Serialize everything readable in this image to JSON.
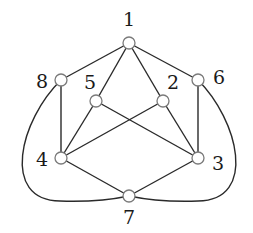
{
  "diagram": {
    "type": "graph",
    "nodes": [
      {
        "id": "1",
        "label": "1",
        "x": 129,
        "y": 43,
        "lx": 129,
        "ly": 26
      },
      {
        "id": "2",
        "label": "2",
        "x": 163,
        "y": 101,
        "lx": 173,
        "ly": 89
      },
      {
        "id": "3",
        "label": "3",
        "x": 198,
        "y": 158,
        "lx": 218,
        "ly": 170
      },
      {
        "id": "4",
        "label": "4",
        "x": 61,
        "y": 158,
        "lx": 42,
        "ly": 166
      },
      {
        "id": "5",
        "label": "5",
        "x": 96,
        "y": 101,
        "lx": 90,
        "ly": 89
      },
      {
        "id": "6",
        "label": "6",
        "x": 198,
        "y": 80,
        "lx": 219,
        "ly": 84
      },
      {
        "id": "7",
        "label": "7",
        "x": 129,
        "y": 196,
        "lx": 129,
        "ly": 224
      },
      {
        "id": "8",
        "label": "8",
        "x": 61,
        "y": 80,
        "lx": 42,
        "ly": 88
      }
    ],
    "edges": [
      {
        "from": "1",
        "to": "8"
      },
      {
        "from": "1",
        "to": "5"
      },
      {
        "from": "1",
        "to": "2"
      },
      {
        "from": "1",
        "to": "6"
      },
      {
        "from": "8",
        "to": "4"
      },
      {
        "from": "6",
        "to": "3"
      },
      {
        "from": "5",
        "to": "4"
      },
      {
        "from": "5",
        "to": "3"
      },
      {
        "from": "2",
        "to": "4"
      },
      {
        "from": "2",
        "to": "3"
      },
      {
        "from": "4",
        "to": "7"
      },
      {
        "from": "3",
        "to": "7"
      },
      {
        "from": "8",
        "to": "7",
        "curved": true
      },
      {
        "from": "6",
        "to": "7",
        "curved": true
      }
    ],
    "node_radius": 6,
    "colors": {
      "edge": "#2a2a2a",
      "node_stroke": "#7a7a7a",
      "node_fill": "#ffffff"
    }
  }
}
